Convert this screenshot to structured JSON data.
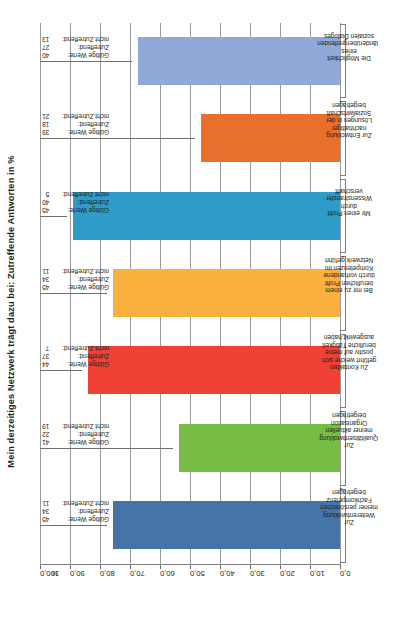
{
  "chart_data": {
    "type": "bar",
    "title": "Mein derzeitiges Netzwerk trägt dazu bei: Zutreffende Antworten in %",
    "xlabel": "",
    "ylabel": "%",
    "ylim": [
      0,
      100
    ],
    "ytick_labels": [
      "100,0",
      "90,0",
      "80,0",
      "70,0",
      "60,0",
      "50,0",
      "40,0",
      "30,0",
      "20,0",
      "10,0",
      "0,0"
    ],
    "ytick_values": [
      100,
      90,
      80,
      70,
      60,
      50,
      40,
      30,
      20,
      10,
      0
    ],
    "axis_unit_symbol": "%",
    "grid": true,
    "legend": "none",
    "categories": [
      "Zur Weiterentwicklung meiner persönlichen Fachkompetenz beigetragen",
      "Zur Qualitätsentwicklung meiner aktuellen Organisation beigetragen",
      "Zu Kontakten geführt welche sich positiv auf meine berufliche Tätigkeit ausgewirkt haben",
      "Bei mir zu einem beruflichen Profit durch vorhandene Kompetenzen im Netzwerk geführt",
      "Mir einen Profit durch Wissenstransfer verschafft",
      "Zur Entwicklung nachhaltiger Lösungen in der Sozialwirtschaft beigetragen",
      "Die Möglichkeit eines länderübergreifenden sozialen Dialoges"
    ],
    "values": [
      75.6,
      53.7,
      84.1,
      75.6,
      88.9,
      46.2,
      67.5
    ],
    "colors": [
      "#4574a8",
      "#77bc43",
      "#ef4136",
      "#fbb040",
      "#2e9bc9",
      "#e8702a",
      "#92a8d8"
    ],
    "annotation_labels": {
      "valid": "Gültige Werte:",
      "applies": "Zutreffend:",
      "not_applies": "nicht Zutreffend:"
    },
    "annotations": [
      {
        "valid": "45",
        "applies": "34",
        "not_applies": "11"
      },
      {
        "valid": "41",
        "applies": "22",
        "not_applies": "19"
      },
      {
        "valid": "44",
        "applies": "37",
        "not_applies": "7"
      },
      {
        "valid": "45",
        "applies": "34",
        "not_applies": "11"
      },
      {
        "valid": "45",
        "applies": "40",
        "not_applies": "5"
      },
      {
        "valid": "39",
        "applies": "18",
        "not_applies": "21"
      },
      {
        "valid": "40",
        "applies": "27",
        "not_applies": "13"
      }
    ]
  }
}
